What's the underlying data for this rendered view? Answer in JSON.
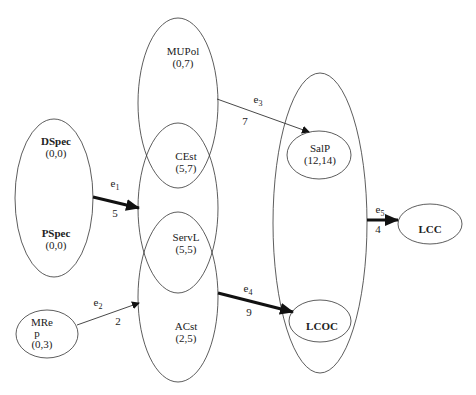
{
  "diagram": {
    "nodes": {
      "dspec": {
        "name": "DSpec",
        "value": "(0,0)"
      },
      "pspec": {
        "name": "PSpec",
        "value": "(0,0)"
      },
      "mrep": {
        "name_line1": "MRe",
        "name_line2": "p",
        "value": "(0,3)"
      },
      "mupol": {
        "name": "MUPol",
        "value": "(0,7)"
      },
      "cest": {
        "name": "CEst",
        "value": "(5,7)"
      },
      "servl": {
        "name": "ServL",
        "value": "(5,5)"
      },
      "acst": {
        "name": "ACst",
        "value": "(2,5)"
      },
      "salp": {
        "name": "SalP",
        "value": "(12,14)"
      },
      "lcoc": {
        "name": "LCOC"
      },
      "lcc": {
        "name": "LCC"
      }
    },
    "edges": {
      "e1": {
        "label": "e",
        "sub": "1",
        "weight": "5"
      },
      "e2": {
        "label": "e",
        "sub": "2",
        "weight": "2"
      },
      "e3": {
        "label": "e",
        "sub": "3",
        "weight": "7"
      },
      "e4": {
        "label": "e",
        "sub": "4",
        "weight": "9"
      },
      "e5": {
        "label": "e",
        "sub": "5",
        "weight": "4"
      }
    }
  }
}
